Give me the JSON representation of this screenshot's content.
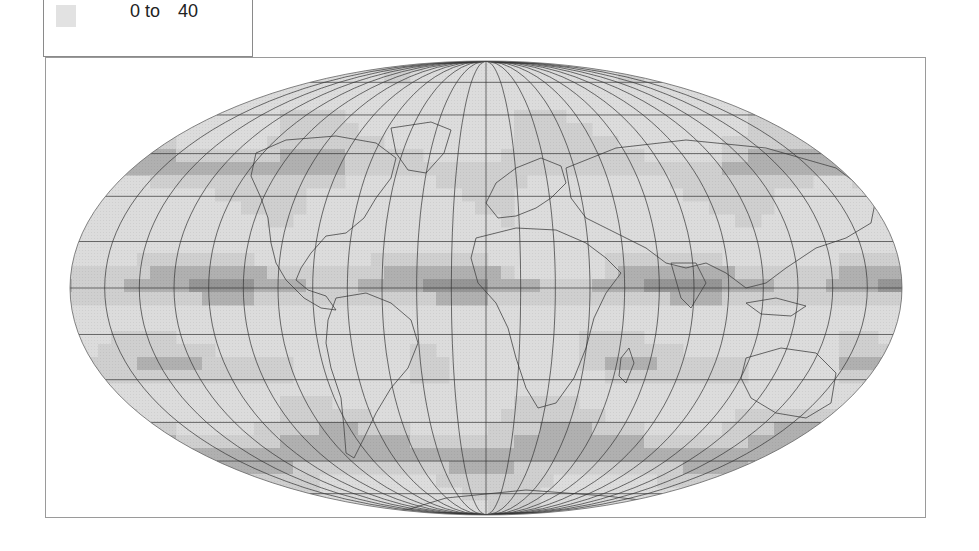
{
  "legend": {
    "items": [
      {
        "label_min": "0 to",
        "label_max": "40",
        "color": "#e2e2e2"
      }
    ]
  },
  "map": {
    "projection": "Mollweide",
    "graticule_interval_deg": 15,
    "shading_palette": [
      "#e6e6e6",
      "#cfcfcf",
      "#b0b0b0",
      "#959595",
      "#7d7d7d"
    ],
    "outline_color": "#444444",
    "graticule_color": "#333333"
  }
}
